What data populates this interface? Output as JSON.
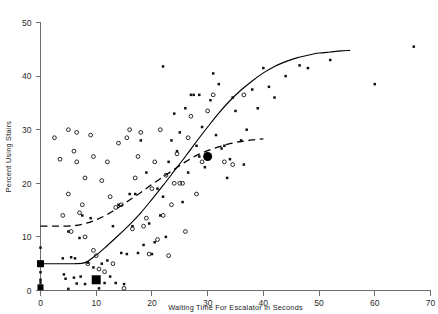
{
  "chart_data": {
    "type": "scatter",
    "title": "",
    "xlabel": "Waiting Time For Escalator in Seconds",
    "ylabel": "Percent Using Stairs",
    "xlim": [
      0,
      70
    ],
    "ylim": [
      0,
      50
    ],
    "xticks": [
      0,
      10,
      20,
      30,
      40,
      50,
      60,
      70
    ],
    "yticks": [
      0,
      10,
      20,
      30,
      40,
      50
    ],
    "xtick_labels": [
      "0",
      "10",
      "20",
      "30",
      "40",
      "50",
      "60",
      "70"
    ],
    "ytick_labels": [
      "0",
      "10",
      "20",
      "30",
      "40",
      "50"
    ],
    "grid": false,
    "legend": "none",
    "series": [
      {
        "name": "filled-square-observations",
        "marker": "filled-square",
        "points": [
          [
            0,
            5.0
          ],
          [
            0,
            5.0
          ],
          [
            0,
            4.6
          ],
          [
            0,
            3.4
          ],
          [
            0,
            8.0
          ],
          [
            0,
            1.5
          ],
          [
            0,
            0.6
          ],
          [
            0,
            0.4
          ],
          [
            0,
            0.5
          ],
          [
            0,
            2.0
          ],
          [
            4.0,
            6.0
          ],
          [
            4.2,
            3.0
          ],
          [
            4.5,
            2.2
          ],
          [
            5.0,
            11.0
          ],
          [
            5.0,
            0.3
          ],
          [
            5.5,
            6.2
          ],
          [
            6.0,
            2.4
          ],
          [
            6.2,
            6.0
          ],
          [
            6.5,
            1.3
          ],
          [
            7.0,
            9.8
          ],
          [
            7.2,
            2.6
          ],
          [
            7.5,
            14.0
          ],
          [
            8.0,
            1.2
          ],
          [
            8.5,
            5.2
          ],
          [
            9.0,
            13.5
          ],
          [
            9.5,
            4.3
          ],
          [
            10.0,
            2.0
          ],
          [
            10.5,
            0.4
          ],
          [
            11.0,
            5.0
          ],
          [
            11.5,
            1.4
          ],
          [
            12.0,
            5.6
          ],
          [
            12.5,
            2.6
          ],
          [
            13.0,
            12.0
          ],
          [
            13.5,
            1.4
          ],
          [
            14.0,
            16.0
          ],
          [
            14.5,
            7.0
          ],
          [
            15.0,
            1.2
          ],
          [
            15.5,
            6.8
          ],
          [
            16.0,
            18.0
          ],
          [
            16.5,
            12.0
          ],
          [
            17.0,
            18.0
          ],
          [
            17.5,
            7.0
          ],
          [
            18.0,
            28.0
          ],
          [
            18.5,
            8.5
          ],
          [
            19.0,
            22.0
          ],
          [
            19.5,
            12.5
          ],
          [
            20.0,
            6.8
          ],
          [
            20.5,
            9.0
          ],
          [
            21.0,
            19.0
          ],
          [
            21.5,
            14.0
          ],
          [
            22.0,
            17.5
          ],
          [
            22.5,
            10.0
          ],
          [
            23.0,
            24.0
          ],
          [
            23.5,
            28.0
          ],
          [
            24.0,
            33.0
          ],
          [
            24.5,
            26.0
          ],
          [
            25.0,
            29.5
          ],
          [
            25.5,
            16.5
          ],
          [
            26.0,
            34.0
          ],
          [
            26.5,
            22.0
          ],
          [
            27.0,
            36.5
          ],
          [
            27.5,
            36.5
          ],
          [
            28.0,
            27.0
          ],
          [
            28.5,
            25.0
          ],
          [
            29.0,
            30.5
          ],
          [
            29.5,
            23.0
          ],
          [
            30.0,
            25.0
          ],
          [
            30.5,
            35.5
          ],
          [
            31.0,
            40.5
          ],
          [
            31.5,
            29.0
          ],
          [
            32.0,
            38.5
          ],
          [
            32.5,
            26.5
          ],
          [
            33.0,
            27.0
          ],
          [
            33.5,
            21.0
          ],
          [
            34.0,
            24.5
          ],
          [
            34.5,
            36.0
          ],
          [
            35.0,
            33.5
          ],
          [
            36.0,
            28.0
          ],
          [
            36.5,
            23.5
          ],
          [
            37.0,
            30.0
          ],
          [
            38.0,
            37.5
          ],
          [
            39.0,
            34.0
          ],
          [
            40.0,
            41.5
          ],
          [
            41.0,
            38.0
          ],
          [
            42.0,
            36.0
          ],
          [
            44.0,
            40.0
          ],
          [
            46.5,
            42.0
          ],
          [
            48.0,
            41.5
          ],
          [
            52.0,
            43.0
          ],
          [
            60.0,
            38.5
          ],
          [
            67.0,
            45.5
          ],
          [
            22.0,
            41.8
          ],
          [
            28.5,
            36.5
          ]
        ]
      },
      {
        "name": "open-circle-observations",
        "marker": "open-circle",
        "points": [
          [
            4.0,
            14.0
          ],
          [
            5.0,
            18.0
          ],
          [
            5.5,
            11.0
          ],
          [
            6.0,
            26.0
          ],
          [
            6.5,
            24.0
          ],
          [
            7.0,
            14.5
          ],
          [
            7.5,
            16.0
          ],
          [
            8.0,
            10.0
          ],
          [
            8.5,
            5.0
          ],
          [
            9.0,
            29.0
          ],
          [
            9.5,
            7.5
          ],
          [
            10.0,
            6.5
          ],
          [
            10.5,
            4.0
          ],
          [
            11.0,
            20.5
          ],
          [
            11.5,
            3.5
          ],
          [
            12.0,
            24.0
          ],
          [
            12.5,
            17.5
          ],
          [
            13.0,
            5.0
          ],
          [
            13.5,
            15.5
          ],
          [
            14.0,
            27.5
          ],
          [
            14.5,
            16.0
          ],
          [
            15.0,
            0.4
          ],
          [
            15.5,
            28.5
          ],
          [
            16.0,
            30.0
          ],
          [
            16.5,
            11.5
          ],
          [
            17.0,
            21.0
          ],
          [
            17.5,
            25.0
          ],
          [
            18.0,
            29.5
          ],
          [
            18.5,
            12.0
          ],
          [
            19.0,
            13.5
          ],
          [
            19.5,
            6.8
          ],
          [
            20.0,
            19.0
          ],
          [
            20.5,
            24.0
          ],
          [
            21.0,
            9.5
          ],
          [
            21.5,
            30.0
          ],
          [
            22.0,
            14.0
          ],
          [
            22.5,
            21.5
          ],
          [
            23.0,
            6.5
          ],
          [
            23.5,
            16.0
          ],
          [
            24.0,
            20.0
          ],
          [
            24.5,
            25.5
          ],
          [
            25.0,
            20.0
          ],
          [
            25.5,
            20.0
          ],
          [
            26.0,
            11.0
          ],
          [
            26.5,
            28.5
          ],
          [
            27.0,
            32.5
          ],
          [
            28.0,
            18.0
          ],
          [
            29.0,
            24.0
          ],
          [
            30.0,
            33.5
          ],
          [
            31.0,
            36.5
          ],
          [
            33.0,
            24.0
          ],
          [
            34.5,
            23.5
          ],
          [
            36.5,
            36.5
          ],
          [
            5.0,
            30.0
          ],
          [
            2.5,
            28.5
          ],
          [
            3.5,
            24.5
          ],
          [
            8.0,
            21.0
          ],
          [
            9.5,
            25.0
          ],
          [
            6.5,
            29.5
          ]
        ]
      },
      {
        "name": "highlighted-markers",
        "marker": "large-filled",
        "points": [
          {
            "x": 0,
            "y": 5.0,
            "shape": "square",
            "size": 7
          },
          {
            "x": 0,
            "y": 0.6,
            "shape": "square",
            "size": 6
          },
          {
            "x": 10,
            "y": 2.0,
            "shape": "square",
            "size": 9
          },
          {
            "x": 30,
            "y": 25.0,
            "shape": "circle",
            "size": 9
          }
        ]
      }
    ],
    "fitted_curves": [
      {
        "name": "solid-logistic-fit",
        "style": "solid",
        "points": [
          [
            0.0,
            5.0
          ],
          [
            3.0,
            5.0
          ],
          [
            6.0,
            5.0
          ],
          [
            8.0,
            5.2
          ],
          [
            10.0,
            6.6
          ],
          [
            12.0,
            8.4
          ],
          [
            14.0,
            10.3
          ],
          [
            16.0,
            12.3
          ],
          [
            18.0,
            14.5
          ],
          [
            20.0,
            17.0
          ],
          [
            22.0,
            19.6
          ],
          [
            24.0,
            22.3
          ],
          [
            26.0,
            25.0
          ],
          [
            28.0,
            27.8
          ],
          [
            30.0,
            30.5
          ],
          [
            32.0,
            33.1
          ],
          [
            34.0,
            35.4
          ],
          [
            36.0,
            37.4
          ],
          [
            38.0,
            39.1
          ],
          [
            40.0,
            40.6
          ],
          [
            42.0,
            41.8
          ],
          [
            44.0,
            42.7
          ],
          [
            46.0,
            43.4
          ],
          [
            48.0,
            43.9
          ],
          [
            50.0,
            44.3
          ],
          [
            52.0,
            44.5
          ],
          [
            54.0,
            44.7
          ],
          [
            55.5,
            44.8
          ]
        ]
      },
      {
        "name": "dashed-fit",
        "style": "dashed",
        "points": [
          [
            0.0,
            12.0
          ],
          [
            3.0,
            12.0
          ],
          [
            6.0,
            12.1
          ],
          [
            8.0,
            12.5
          ],
          [
            10.0,
            13.2
          ],
          [
            12.0,
            14.2
          ],
          [
            14.0,
            15.5
          ],
          [
            16.0,
            16.9
          ],
          [
            18.0,
            18.3
          ],
          [
            20.0,
            19.8
          ],
          [
            22.0,
            21.2
          ],
          [
            24.0,
            22.6
          ],
          [
            26.0,
            24.0
          ],
          [
            28.0,
            25.2
          ],
          [
            30.0,
            26.1
          ],
          [
            32.0,
            26.8
          ],
          [
            34.0,
            27.4
          ],
          [
            36.0,
            27.8
          ],
          [
            38.0,
            28.1
          ],
          [
            40.0,
            28.3
          ]
        ]
      }
    ]
  },
  "figure": {
    "background_color": "#ffffff",
    "axis_color": "#6e6e6e",
    "data_color": "#111111",
    "curve_color": "#000000"
  }
}
